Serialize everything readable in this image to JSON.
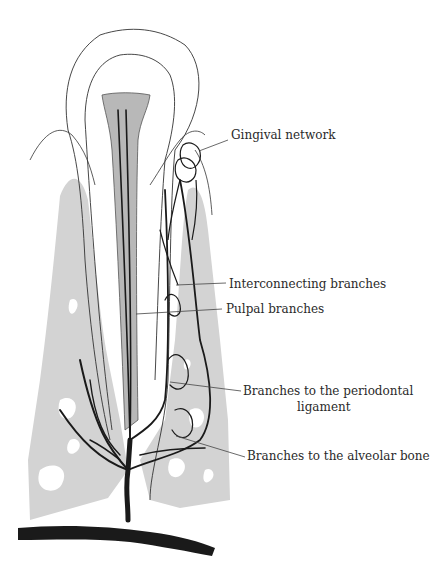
{
  "figure": {
    "colors": {
      "bone": "#d3d3d3",
      "pulp": "#b8b8b8",
      "vessel": "#1a1a1a",
      "outline": "#333333",
      "leader": "#444444"
    }
  },
  "labels": [
    {
      "id": "gingival",
      "text": "Gingival network",
      "x": 231,
      "y": 135
    },
    {
      "id": "interconnecting",
      "text": "Interconnecting branches",
      "x": 229,
      "y": 277
    },
    {
      "id": "pulpal",
      "text": "Pulpal branches",
      "x": 226,
      "y": 302
    },
    {
      "id": "periodontal_line1",
      "text": "Branches to the periodontal",
      "x": 243,
      "y": 384
    },
    {
      "id": "periodontal_line2",
      "text": "ligament",
      "x": 297,
      "y": 400
    },
    {
      "id": "alveolar",
      "text": "Branches to the alveolar bone",
      "x": 247,
      "y": 449
    }
  ]
}
